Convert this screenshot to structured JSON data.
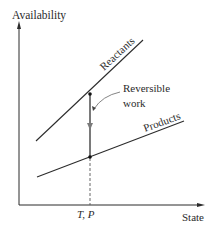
{
  "diagram": {
    "y_axis_label": "Availability",
    "x_axis_label": "State",
    "x_marker_label": "T, P",
    "lines": [
      {
        "name": "Reactants",
        "x1": 36,
        "y1": 141,
        "x2": 143,
        "y2": 40
      },
      {
        "name": "Products",
        "x1": 37,
        "y1": 177,
        "x2": 184,
        "y2": 121
      }
    ],
    "annotation": {
      "line1": "Reversible",
      "line2": "work"
    },
    "colors": {
      "ink": "#2b2b2b",
      "work_arrow": "#7a7a7a",
      "background": "#ffffff"
    }
  }
}
